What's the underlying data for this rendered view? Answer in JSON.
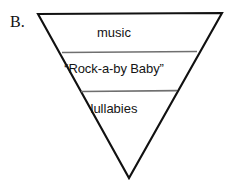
{
  "figure": {
    "panel_label": "B.",
    "shape": "inverted-triangle",
    "outline_color": "#111111",
    "divider_color": "#6f6f6f",
    "background_color": "#ffffff",
    "tiers": [
      {
        "label": "music"
      },
      {
        "label": "“Rock-a-by Baby”"
      },
      {
        "label": "lullabies"
      }
    ]
  }
}
